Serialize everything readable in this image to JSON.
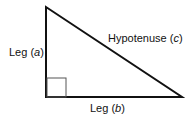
{
  "diagram": {
    "colors": {
      "stroke": "#111111",
      "right_angle_marker": "#555555",
      "background": "#ffffff"
    },
    "vertices": {
      "top": [
        46,
        7
      ],
      "right_angle": [
        46,
        97
      ],
      "right": [
        182,
        97
      ]
    },
    "right_angle_marker": {
      "x": 47,
      "y": 78,
      "size": 19
    },
    "labels": {
      "leg_a": {
        "prefix": "Leg (",
        "var": "a",
        "suffix": ")"
      },
      "hypotenuse": {
        "prefix": "Hypotenuse (",
        "var": "c",
        "suffix": ")"
      },
      "leg_b": {
        "prefix": "Leg (",
        "var": "b",
        "suffix": ")"
      }
    }
  }
}
